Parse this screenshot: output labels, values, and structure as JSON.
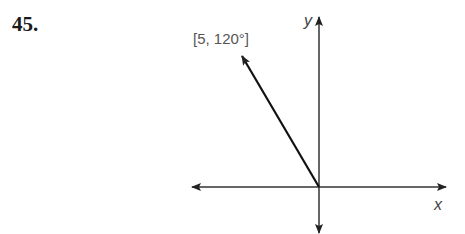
{
  "problem_number": "45.",
  "vector": {
    "label": "[5, 120°]",
    "magnitude": 5,
    "angle_deg": 120
  },
  "axes": {
    "x_label": "x",
    "y_label": "y"
  },
  "colors": {
    "line": "#222222",
    "label": "#555555"
  }
}
